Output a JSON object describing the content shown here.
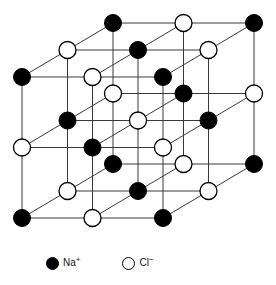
{
  "figure": {
    "width": 276,
    "height": 285,
    "background_color": "#ffffff"
  },
  "lattice": {
    "description": "3 x 3 x 3 face-centred cubic rock-salt arrangement of alternating sodium and chloride ions drawn in oblique projection",
    "grid_counts": {
      "x": 3,
      "y": 3,
      "z": 3
    },
    "origin": {
      "x": 22,
      "y": 218
    },
    "step_x": 70.5,
    "step_y": -70.5,
    "depth_step": {
      "x": 45.5,
      "y": -27
    },
    "bond_color": "#3a3a3a",
    "bond_width": 1,
    "ion_radius": 8.5,
    "ion_types": [
      {
        "key": "na",
        "symbol": "Na",
        "charge": "+",
        "label": "Na+",
        "fill": "#000000",
        "stroke": "#000000",
        "parity": 0
      },
      {
        "key": "cl",
        "symbol": "Cl",
        "charge": "−",
        "label": "Cl-",
        "fill": "#ffffff",
        "stroke": "#000000",
        "parity": 1
      }
    ]
  },
  "legend": {
    "entries": [
      {
        "key": "na",
        "swatch": "filled",
        "symbol": "Na",
        "charge": "+"
      },
      {
        "key": "cl",
        "swatch": "open",
        "symbol": "Cl",
        "charge": "−"
      }
    ]
  }
}
